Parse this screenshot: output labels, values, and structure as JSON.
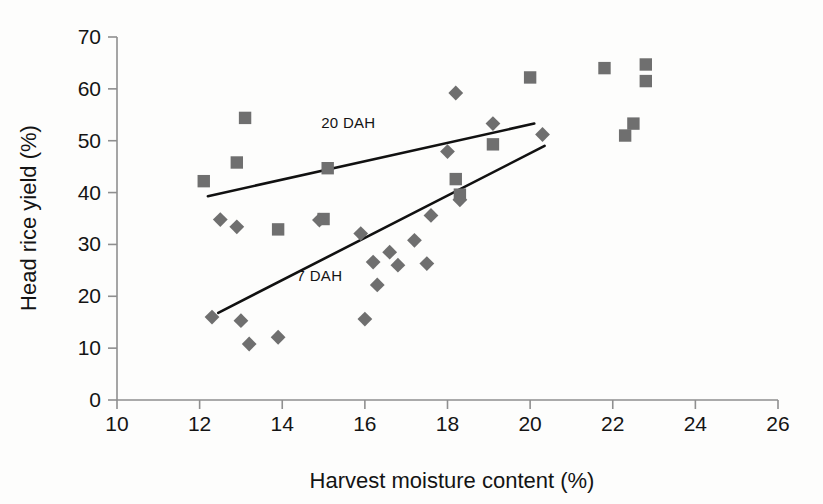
{
  "chart_data": {
    "type": "scatter",
    "title": "",
    "xlabel": "Harvest moisture content (%)",
    "ylabel": "Head rice yield (%)",
    "xlim": [
      10,
      26
    ],
    "ylim": [
      0,
      70
    ],
    "xticks": [
      10,
      12,
      14,
      16,
      18,
      20,
      22,
      24,
      26
    ],
    "yticks": [
      0,
      10,
      20,
      30,
      40,
      50,
      60,
      70
    ],
    "grid": false,
    "legend_position": "inline-annotation",
    "marker_color": "#6f6f6f",
    "line_color": "#111111",
    "axis_color": "#8f8f8f",
    "series": [
      {
        "name": "20 DAH",
        "marker": "square",
        "label": "20 DAH",
        "label_x": 15.6,
        "label_y": 52.5,
        "points": [
          {
            "x": 12.1,
            "y": 42.2
          },
          {
            "x": 12.9,
            "y": 45.8
          },
          {
            "x": 13.1,
            "y": 54.4
          },
          {
            "x": 13.9,
            "y": 32.9
          },
          {
            "x": 15.0,
            "y": 34.9
          },
          {
            "x": 15.1,
            "y": 44.7
          },
          {
            "x": 18.2,
            "y": 42.6
          },
          {
            "x": 18.3,
            "y": 39.6
          },
          {
            "x": 19.1,
            "y": 49.3
          },
          {
            "x": 20.0,
            "y": 62.2
          },
          {
            "x": 21.8,
            "y": 64.0
          },
          {
            "x": 22.3,
            "y": 51.0
          },
          {
            "x": 22.5,
            "y": 53.3
          },
          {
            "x": 22.8,
            "y": 64.7
          },
          {
            "x": 22.8,
            "y": 61.5
          }
        ],
        "trend": {
          "x1": 12.2,
          "y1": 39.3,
          "x2": 20.1,
          "y2": 53.3
        }
      },
      {
        "name": "7 DAH",
        "marker": "diamond",
        "label": "7 DAH",
        "label_x": 14.9,
        "label_y": 23.0,
        "points": [
          {
            "x": 12.3,
            "y": 16.0
          },
          {
            "x": 12.5,
            "y": 34.8
          },
          {
            "x": 12.9,
            "y": 33.4
          },
          {
            "x": 13.0,
            "y": 15.3
          },
          {
            "x": 13.2,
            "y": 10.8
          },
          {
            "x": 13.9,
            "y": 12.1
          },
          {
            "x": 14.9,
            "y": 34.7
          },
          {
            "x": 15.9,
            "y": 32.1
          },
          {
            "x": 16.0,
            "y": 15.6
          },
          {
            "x": 16.2,
            "y": 26.6
          },
          {
            "x": 16.3,
            "y": 22.2
          },
          {
            "x": 16.6,
            "y": 28.5
          },
          {
            "x": 16.8,
            "y": 26.0
          },
          {
            "x": 17.2,
            "y": 30.8
          },
          {
            "x": 17.5,
            "y": 26.3
          },
          {
            "x": 17.6,
            "y": 35.6
          },
          {
            "x": 18.0,
            "y": 47.9
          },
          {
            "x": 18.2,
            "y": 59.2
          },
          {
            "x": 18.3,
            "y": 38.6
          },
          {
            "x": 19.1,
            "y": 53.3
          },
          {
            "x": 20.3,
            "y": 51.2
          }
        ],
        "trend": {
          "x1": 12.45,
          "y1": 16.8,
          "x2": 20.35,
          "y2": 49.0
        }
      }
    ]
  }
}
